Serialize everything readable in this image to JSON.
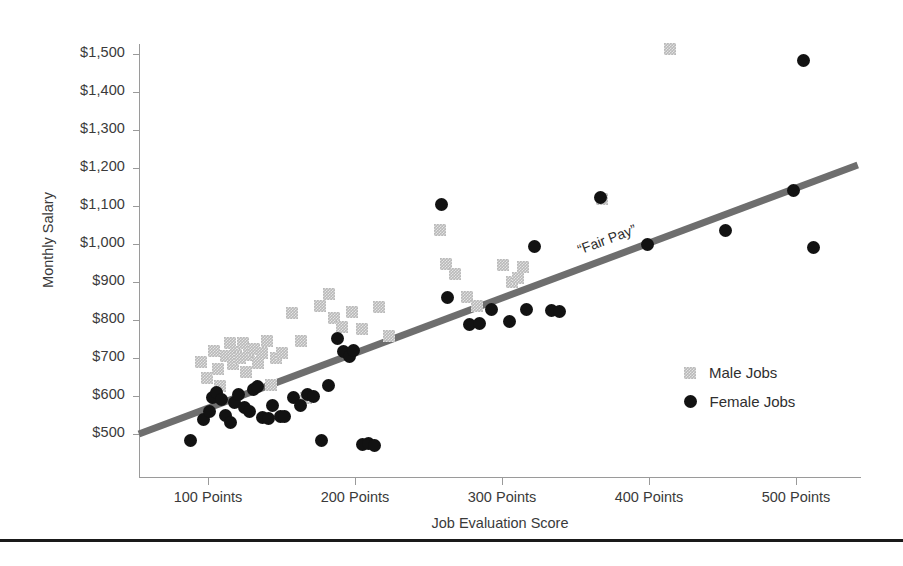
{
  "chart_data": {
    "type": "scatter",
    "title": "",
    "xlabel": "Job Evaluation Score",
    "ylabel": "Monthly Salary",
    "xlim": [
      50,
      540
    ],
    "ylim": [
      440,
      1560
    ],
    "grid": false,
    "legend_position": "inside-right",
    "x_tick_labels": [
      "100 Points",
      "200 Points",
      "300 Points",
      "400 Points",
      "500 Points"
    ],
    "x_tick_values": [
      100,
      200,
      300,
      400,
      500
    ],
    "y_tick_labels": [
      "$1,500",
      "$1,400",
      "$1,300",
      "$1,200",
      "$1,100",
      "$1,000",
      "$900",
      "$800",
      "$700",
      "$600",
      "$500"
    ],
    "y_tick_values": [
      1500,
      1400,
      1300,
      1200,
      1100,
      1000,
      900,
      800,
      700,
      600,
      500
    ],
    "annotations": [
      {
        "text": "“Fair Pay”",
        "x": 352,
        "y": 985,
        "rotation_deg": -20.6
      }
    ],
    "trendline": {
      "label": "“Fair Pay”",
      "color": "#6e6e6e",
      "width_px": 7,
      "x_start": 53,
      "y_start": 500,
      "x_end": 542,
      "y_end": 1208
    },
    "series": [
      {
        "name": "Male Jobs",
        "marker": "square",
        "color": "#b9b9b9",
        "points": [
          [
            95,
            690
          ],
          [
            99,
            648
          ],
          [
            104,
            718
          ],
          [
            107,
            672
          ],
          [
            108,
            627
          ],
          [
            112,
            706
          ],
          [
            115,
            739
          ],
          [
            117,
            683
          ],
          [
            119,
            717
          ],
          [
            122,
            700
          ],
          [
            124,
            740
          ],
          [
            126,
            662
          ],
          [
            128,
            708
          ],
          [
            131,
            724
          ],
          [
            134,
            686
          ],
          [
            137,
            713
          ],
          [
            140,
            745
          ],
          [
            143,
            629
          ],
          [
            146,
            700
          ],
          [
            150,
            712
          ],
          [
            157,
            818
          ],
          [
            163,
            745
          ],
          [
            167,
            596
          ],
          [
            176,
            838
          ],
          [
            182,
            868
          ],
          [
            186,
            806
          ],
          [
            191,
            782
          ],
          [
            198,
            820
          ],
          [
            205,
            776
          ],
          [
            216,
            835
          ],
          [
            223,
            757
          ],
          [
            258,
            1037
          ],
          [
            262,
            947
          ],
          [
            268,
            922
          ],
          [
            276,
            861
          ],
          [
            283,
            838
          ],
          [
            301,
            946
          ],
          [
            307,
            900
          ],
          [
            311,
            910
          ],
          [
            314,
            940
          ],
          [
            368,
            1118
          ],
          [
            414,
            1513
          ]
        ]
      },
      {
        "name": "Female Jobs",
        "marker": "circle",
        "color": "#121212",
        "points": [
          [
            88,
            482
          ],
          [
            97,
            537
          ],
          [
            101,
            560
          ],
          [
            103,
            596
          ],
          [
            106,
            609
          ],
          [
            109,
            592
          ],
          [
            112,
            548
          ],
          [
            115,
            529
          ],
          [
            118,
            584
          ],
          [
            121,
            604
          ],
          [
            125,
            570
          ],
          [
            128,
            560
          ],
          [
            131,
            616
          ],
          [
            134,
            624
          ],
          [
            137,
            543
          ],
          [
            141,
            541
          ],
          [
            144,
            575
          ],
          [
            149,
            545
          ],
          [
            152,
            547
          ],
          [
            158,
            595
          ],
          [
            163,
            574
          ],
          [
            168,
            604
          ],
          [
            172,
            598
          ],
          [
            177,
            482
          ],
          [
            182,
            627
          ],
          [
            188,
            751
          ],
          [
            192,
            716
          ],
          [
            196,
            704
          ],
          [
            199,
            721
          ],
          [
            205,
            472
          ],
          [
            209,
            476
          ],
          [
            213,
            469
          ],
          [
            259,
            1105
          ],
          [
            263,
            858
          ],
          [
            278,
            788
          ],
          [
            285,
            790
          ],
          [
            293,
            828
          ],
          [
            305,
            795
          ],
          [
            317,
            827
          ],
          [
            322,
            994
          ],
          [
            334,
            824
          ],
          [
            339,
            823
          ],
          [
            367,
            1122
          ],
          [
            399,
            1000
          ],
          [
            452,
            1036
          ],
          [
            498,
            1140
          ],
          [
            505,
            1482
          ],
          [
            512,
            991
          ]
        ]
      }
    ]
  },
  "legend": {
    "items": [
      {
        "label": "Male Jobs",
        "marker": "square",
        "color": "#b9b9b9"
      },
      {
        "label": "Female Jobs",
        "marker": "circle",
        "color": "#121212"
      }
    ]
  },
  "axes": {
    "y_title": "Monthly Salary",
    "x_title": "Job Evaluation Score"
  }
}
